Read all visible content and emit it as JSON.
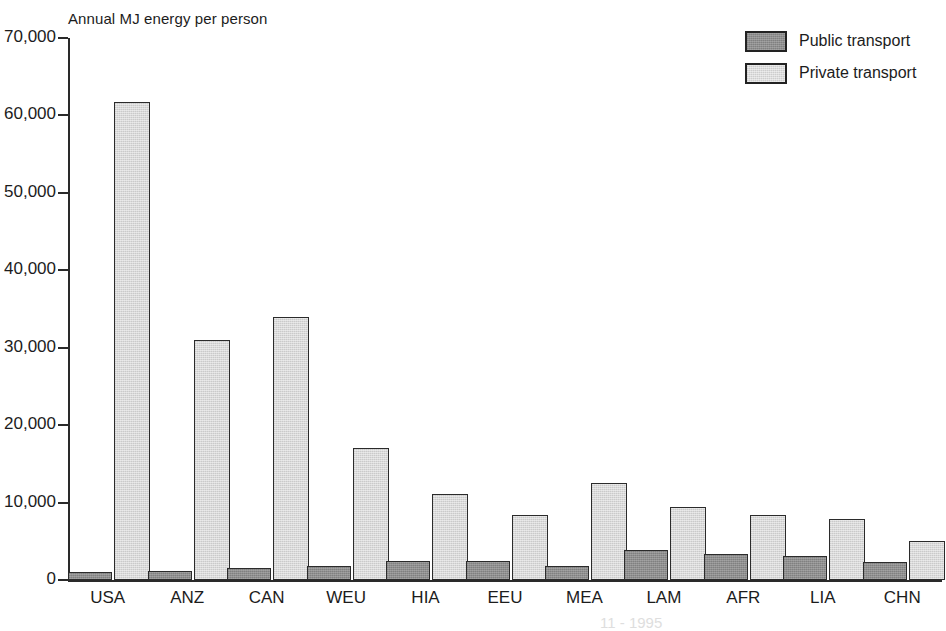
{
  "chart_data": {
    "type": "bar",
    "title": "Annual MJ energy per person",
    "xlabel": "",
    "ylabel": "",
    "ylim": [
      0,
      70000
    ],
    "ytick_values": [
      0,
      10000,
      20000,
      30000,
      40000,
      50000,
      60000,
      70000
    ],
    "ytick_labels": [
      "0",
      "10,000",
      "20,000",
      "30,000",
      "40,000",
      "50,000",
      "60,000",
      "70,000"
    ],
    "grid": false,
    "legend_position": "top-right",
    "categories": [
      "USA",
      "ANZ",
      "CAN",
      "WEU",
      "HIA",
      "EEU",
      "MEA",
      "LAM",
      "AFR",
      "LIA",
      "CHN"
    ],
    "series": [
      {
        "name": "Public transport",
        "color": "#8e8e8e",
        "values": [
          1000,
          1200,
          1600,
          1800,
          2400,
          2400,
          1800,
          3900,
          3400,
          3100,
          2300
        ]
      },
      {
        "name": "Private transport",
        "color": "#d9d9d9",
        "values": [
          61700,
          31000,
          34000,
          17000,
          11100,
          8400,
          12500,
          9400,
          8400,
          7900,
          5000
        ]
      }
    ]
  },
  "legend": {
    "items": [
      {
        "label": "Public transport",
        "swatch": "public"
      },
      {
        "label": "Private transport",
        "swatch": "private"
      }
    ]
  },
  "footnote": "11 -   1995"
}
